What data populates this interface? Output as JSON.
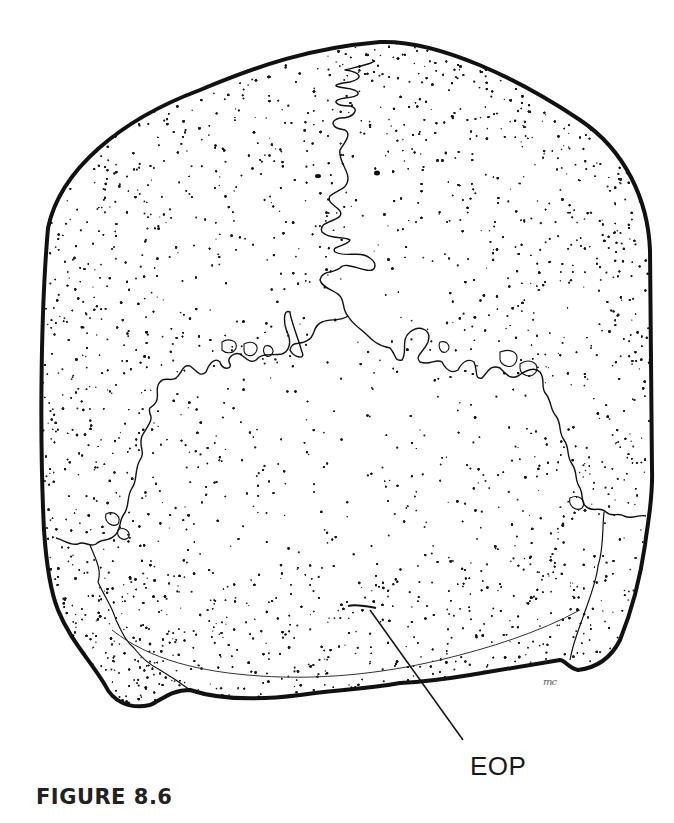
{
  "figure": {
    "labels": [
      {
        "id": "eop",
        "text": "EOP"
      }
    ],
    "caption": "FIGURE 8.6",
    "artist_mark": "mc"
  },
  "colors": {
    "ink": "#111111",
    "background": "#ffffff",
    "caption": "#222222"
  }
}
